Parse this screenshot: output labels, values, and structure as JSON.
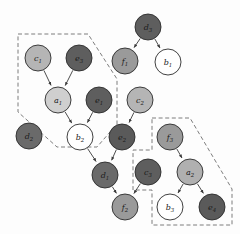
{
  "figure": {
    "type": "directed-acyclic-graph",
    "background": "#fdfdfd",
    "width": 240,
    "height": 234,
    "edge_color": "#3a3a3a",
    "node_outline": "#2b2b2b",
    "plate_color": "#6e6e6e"
  },
  "palette": {
    "white": "#ffffff",
    "light": "#cfcfcf",
    "light_gray": "#b5b5b5",
    "medium": "#9a9a9a",
    "medium_dark": "#8a8a8a",
    "dark": "#5e5e5e",
    "darker": "#4f4f4f"
  },
  "nodes": [
    {
      "id": "c1",
      "base": "c",
      "sub": "1",
      "x": 38,
      "y": 58,
      "r": 13,
      "fill": "#b5b5b5"
    },
    {
      "id": "e3",
      "base": "e",
      "sub": "3",
      "x": 79,
      "y": 58,
      "r": 13,
      "fill": "#5e5e5e"
    },
    {
      "id": "a1",
      "base": "a",
      "sub": "1",
      "x": 58,
      "y": 100,
      "r": 13,
      "fill": "#cfcfcf"
    },
    {
      "id": "e1",
      "base": "e",
      "sub": "1",
      "x": 99,
      "y": 100,
      "r": 13,
      "fill": "#5e5e5e"
    },
    {
      "id": "d2",
      "base": "d",
      "sub": "2",
      "x": 29,
      "y": 136,
      "r": 13,
      "fill": "#6a6a6a"
    },
    {
      "id": "b2",
      "base": "b",
      "sub": "2",
      "x": 80,
      "y": 137,
      "r": 13,
      "fill": "#ffffff"
    },
    {
      "id": "d3",
      "base": "d",
      "sub": "3",
      "x": 148,
      "y": 27,
      "r": 13,
      "fill": "#5e5e5e"
    },
    {
      "id": "f1",
      "base": "f",
      "sub": "1",
      "x": 125,
      "y": 61,
      "r": 13,
      "fill": "#9a9a9a"
    },
    {
      "id": "b1",
      "base": "b",
      "sub": "1",
      "x": 168,
      "y": 62,
      "r": 13,
      "fill": "#ffffff"
    },
    {
      "id": "c2",
      "base": "c",
      "sub": "2",
      "x": 140,
      "y": 100,
      "r": 13,
      "fill": "#b5b5b5"
    },
    {
      "id": "e2",
      "base": "e",
      "sub": "2",
      "x": 122,
      "y": 137,
      "r": 13,
      "fill": "#5a5a5a"
    },
    {
      "id": "f3",
      "base": "f",
      "sub": "3",
      "x": 170,
      "y": 137,
      "r": 13,
      "fill": "#9a9a9a"
    },
    {
      "id": "d1",
      "base": "d",
      "sub": "1",
      "x": 105,
      "y": 175,
      "r": 13,
      "fill": "#6a6a6a"
    },
    {
      "id": "c3",
      "base": "c",
      "sub": "3",
      "x": 148,
      "y": 172,
      "r": 13,
      "fill": "#5e5e5e"
    },
    {
      "id": "a2",
      "base": "a",
      "sub": "2",
      "x": 190,
      "y": 172,
      "r": 13,
      "fill": "#b0b0b0"
    },
    {
      "id": "f2",
      "base": "f",
      "sub": "2",
      "x": 125,
      "y": 207,
      "r": 13,
      "fill": "#9a9a9a"
    },
    {
      "id": "b3",
      "base": "b",
      "sub": "3",
      "x": 170,
      "y": 207,
      "r": 13,
      "fill": "#ffffff"
    },
    {
      "id": "e4",
      "base": "e",
      "sub": "4",
      "x": 212,
      "y": 207,
      "r": 13,
      "fill": "#5a5a5a"
    }
  ],
  "edges": [
    {
      "from": "c1",
      "to": "a1"
    },
    {
      "from": "e3",
      "to": "a1"
    },
    {
      "from": "a1",
      "to": "b2"
    },
    {
      "from": "e1",
      "to": "b2"
    },
    {
      "from": "b2",
      "to": "d1"
    },
    {
      "from": "e2",
      "to": "d1"
    },
    {
      "from": "c2",
      "to": "e2"
    },
    {
      "from": "d3",
      "to": "f1"
    },
    {
      "from": "d3",
      "to": "b1"
    },
    {
      "from": "d1",
      "to": "f2"
    },
    {
      "from": "c3",
      "to": "f2"
    },
    {
      "from": "f3",
      "to": "a2"
    },
    {
      "from": "a2",
      "to": "b3"
    },
    {
      "from": "a2",
      "to": "e4"
    }
  ],
  "plates": [
    {
      "id": "plate-left",
      "members": [
        "c1",
        "e3",
        "a1",
        "e1",
        "b2"
      ],
      "points": "18,34 88,34 117,79 117,124 97,147 57,147 18,112"
    },
    {
      "id": "plate-right",
      "members": [
        "f3",
        "a2",
        "b3",
        "e4"
      ],
      "points": "152,118 190,118 232,189 232,225 152,225 152,190 133,190 133,150 152,150"
    }
  ]
}
